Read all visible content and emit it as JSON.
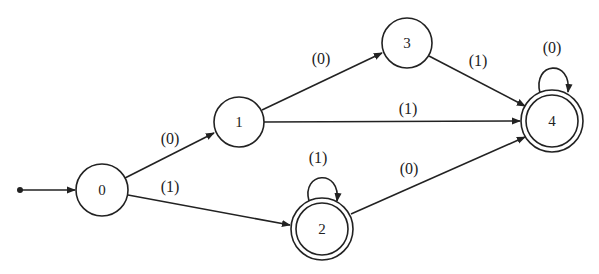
{
  "diagram": {
    "type": "finite-state-automaton",
    "start_state": "0",
    "states": [
      {
        "id": "0",
        "label": "0",
        "accepting": false,
        "x": 102,
        "y": 190
      },
      {
        "id": "1",
        "label": "1",
        "accepting": false,
        "x": 239,
        "y": 122
      },
      {
        "id": "3",
        "label": "3",
        "accepting": false,
        "x": 407,
        "y": 43
      },
      {
        "id": "2",
        "label": "2",
        "accepting": true,
        "x": 322,
        "y": 229
      },
      {
        "id": "4",
        "label": "4",
        "accepting": true,
        "x": 552,
        "y": 121
      }
    ],
    "transitions": [
      {
        "from": "0",
        "to": "1",
        "label": "(0)",
        "label_x": 170,
        "label_y": 138
      },
      {
        "from": "0",
        "to": "2",
        "label": "(1)",
        "label_x": 170,
        "label_y": 186
      },
      {
        "from": "1",
        "to": "3",
        "label": "(0)",
        "label_x": 321,
        "label_y": 58
      },
      {
        "from": "1",
        "to": "4",
        "label": "(1)",
        "label_x": 408,
        "label_y": 108
      },
      {
        "from": "3",
        "to": "4",
        "label": "(1)",
        "label_x": 478,
        "label_y": 60
      },
      {
        "from": "4",
        "to": "4",
        "label": "(0)",
        "label_x": 552,
        "label_y": 47
      },
      {
        "from": "2",
        "to": "2",
        "label": "(1)",
        "label_x": 318,
        "label_y": 157
      },
      {
        "from": "2",
        "to": "4",
        "label": "(0)",
        "label_x": 409,
        "label_y": 168
      }
    ]
  }
}
